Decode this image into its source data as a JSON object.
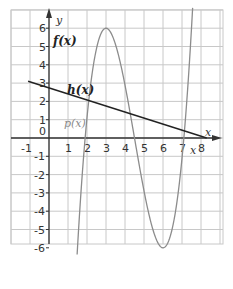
{
  "chart_data": {
    "type": "line",
    "title": "",
    "xlabel": "x",
    "ylabel": "y",
    "xlim": [
      -1.5,
      8.5
    ],
    "ylim": [
      -6.5,
      6.5
    ],
    "grid": true,
    "x_ticks": [
      "-1",
      "0",
      "1",
      "2",
      "3",
      "4",
      "5",
      "6",
      "7",
      "8"
    ],
    "y_ticks": [
      "6",
      "5",
      "4",
      "3",
      "2",
      "1",
      "-1",
      "-2",
      "-3",
      "-4",
      "-5",
      "-6"
    ],
    "series": [
      {
        "name": "f(x)",
        "color": "#8c8c8c",
        "description": "cubic with local max (3, 6) and local min (6, -6)",
        "x": [
          1.5,
          2,
          2.5,
          3,
          3.5,
          4,
          4.5,
          5,
          5.5,
          6,
          6.5,
          7,
          7.5
        ],
        "y": [
          -6,
          0.2,
          4.3,
          6,
          5.1,
          2.7,
          0,
          -3.3,
          -5.1,
          -6,
          -5.3,
          -2.4,
          6
        ]
      },
      {
        "name": "h(x)",
        "color": "#222222",
        "description": "straight line with negative slope",
        "x": [
          -1.1,
          0,
          2,
          4,
          6,
          8.3
        ],
        "y": [
          3.1,
          2.8,
          2.1,
          1.4,
          0.8,
          0
        ]
      }
    ],
    "annotations": [
      {
        "text": "f(x)",
        "x": 0.3,
        "y": 5.3
      },
      {
        "text": "h(x)",
        "x": 1.0,
        "y": 2.6
      },
      {
        "text": "p(x)",
        "x": 0.8,
        "y": 0.7
      },
      {
        "text": "x",
        "x": 7.45,
        "y": -0.7
      },
      {
        "text": "x",
        "x": 8.3,
        "y": 0.35
      }
    ]
  },
  "labels": {
    "y_axis": "y",
    "x_axis": "x",
    "x_axis_secondary": "x",
    "f": "f(x)",
    "h": "h(x)",
    "p": "p(x)",
    "origin": "0"
  }
}
